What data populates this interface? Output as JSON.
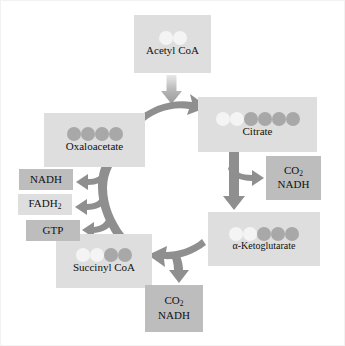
{
  "diagram": {
    "colors": {
      "background": "#ffffff",
      "box_light": "#dedede",
      "box_mid": "#bdbdbd",
      "carbon_light": "#f4f4f4",
      "carbon_dark": "#a8a8a8",
      "arrow": "#8f8f8f",
      "arrow_light": "#cbcbcb",
      "text": "#111111",
      "border": "#f2f2f2"
    },
    "metabolites": [
      {
        "id": "acetyl-coa",
        "label": "Acetyl CoA",
        "carbons_light": 2,
        "carbons_dark": 0,
        "carbon_total": 2
      },
      {
        "id": "citrate",
        "label": "Citrate",
        "carbons_light": 2,
        "carbons_dark": 4,
        "carbon_total": 6
      },
      {
        "id": "alpha-ketoglutarate",
        "label": "α-Ketoglutarate",
        "carbons_light": 2,
        "carbons_dark": 3,
        "carbon_total": 5
      },
      {
        "id": "succinyl-coa",
        "label": "Succinyl CoA",
        "carbons_light": 2,
        "carbons_dark": 2,
        "carbon_total": 4
      },
      {
        "id": "oxaloacetate",
        "label": "Oxaloacetate",
        "carbons_light": 0,
        "carbons_dark": 4,
        "carbon_total": 4
      }
    ],
    "products": [
      {
        "id": "co2-nadh-right",
        "lines": [
          "CO",
          "NADH"
        ],
        "subscript": "2",
        "shade": "mid"
      },
      {
        "id": "co2-nadh-bottom",
        "lines": [
          "CO",
          "NADH"
        ],
        "subscript": "2",
        "shade": "mid"
      },
      {
        "id": "nadh",
        "label": "NADH",
        "shade": "mid"
      },
      {
        "id": "fadh2",
        "label": "FADH",
        "subscript": "2",
        "shade": "light"
      },
      {
        "id": "gtp",
        "label": "GTP",
        "shade": "mid"
      }
    ],
    "arrows": [
      {
        "id": "acetyl-coa-entry",
        "from": "acetyl-coa",
        "to": "cycle",
        "direction": "down"
      },
      {
        "id": "oxaloacetate-to-citrate",
        "from": "oxaloacetate",
        "to": "citrate",
        "direction": "curve-right"
      },
      {
        "id": "citrate-to-alpha-kg",
        "from": "citrate",
        "to": "alpha-ketoglutarate",
        "direction": "down"
      },
      {
        "id": "citrate-branch-co2",
        "from": "citrate",
        "to": "co2-nadh-right",
        "direction": "right"
      },
      {
        "id": "alpha-kg-to-succinyl",
        "from": "alpha-ketoglutarate",
        "to": "succinyl-coa",
        "direction": "curve-left"
      },
      {
        "id": "alpha-kg-branch-co2",
        "from": "alpha-ketoglutarate",
        "to": "co2-nadh-bottom",
        "direction": "down"
      },
      {
        "id": "succinyl-to-oxaloacetate",
        "from": "succinyl-coa",
        "to": "oxaloacetate",
        "direction": "curve-up"
      },
      {
        "id": "branch-nadh",
        "from": "cycle",
        "to": "nadh",
        "direction": "left"
      },
      {
        "id": "branch-fadh2",
        "from": "cycle",
        "to": "fadh2",
        "direction": "left"
      },
      {
        "id": "branch-gtp",
        "from": "cycle",
        "to": "gtp",
        "direction": "left"
      }
    ]
  }
}
